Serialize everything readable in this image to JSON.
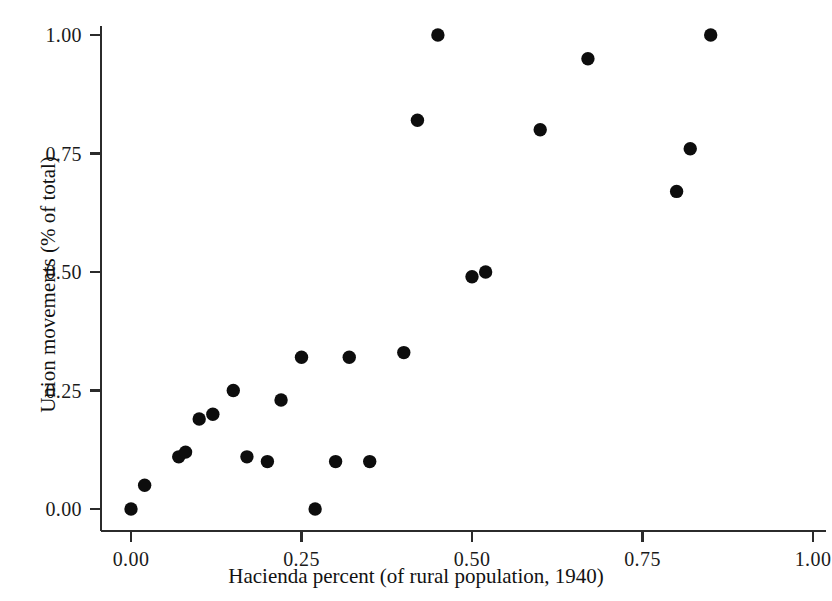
{
  "chart_data": {
    "type": "scatter",
    "title": "",
    "xlabel": "Hacienda percent (of rural population, 1940)",
    "ylabel": "Union movements (% of total)",
    "xlim": [
      0.0,
      1.0
    ],
    "ylim": [
      0.0,
      1.0
    ],
    "xticks": [
      "0.00",
      "0.25",
      "0.50",
      "0.75",
      "1.00"
    ],
    "xtick_values": [
      0.0,
      0.25,
      0.5,
      0.75,
      1.0
    ],
    "yticks": [
      "0.00",
      "0.25",
      "0.50",
      "0.75",
      "1.00"
    ],
    "ytick_values": [
      0.0,
      0.25,
      0.5,
      0.75,
      1.0
    ],
    "grid": false,
    "legend": false,
    "marker": "filled-circle",
    "marker_color": "#0d0d0d",
    "marker_size": 7,
    "point_count": 24,
    "x": [
      0.0,
      0.02,
      0.07,
      0.08,
      0.1,
      0.12,
      0.15,
      0.17,
      0.17,
      0.2,
      0.22,
      0.25,
      0.27,
      0.3,
      0.32,
      0.35,
      0.4,
      0.42,
      0.45,
      0.5,
      0.52,
      0.6,
      0.67,
      0.8,
      0.82,
      0.85
    ],
    "y": [
      0.0,
      0.05,
      0.11,
      0.12,
      0.19,
      0.2,
      0.25,
      0.11,
      0.11,
      0.1,
      0.23,
      0.32,
      0.0,
      0.1,
      0.32,
      0.1,
      0.33,
      0.82,
      1.0,
      0.49,
      0.5,
      0.8,
      0.95,
      0.67,
      0.76,
      1.0
    ],
    "points": [
      {
        "x": 0.0,
        "y": 0.0
      },
      {
        "x": 0.02,
        "y": 0.05
      },
      {
        "x": 0.07,
        "y": 0.11
      },
      {
        "x": 0.08,
        "y": 0.12
      },
      {
        "x": 0.1,
        "y": 0.19
      },
      {
        "x": 0.12,
        "y": 0.2
      },
      {
        "x": 0.15,
        "y": 0.25
      },
      {
        "x": 0.17,
        "y": 0.11
      },
      {
        "x": 0.2,
        "y": 0.1
      },
      {
        "x": 0.22,
        "y": 0.23
      },
      {
        "x": 0.25,
        "y": 0.32
      },
      {
        "x": 0.27,
        "y": 0.0
      },
      {
        "x": 0.3,
        "y": 0.1
      },
      {
        "x": 0.32,
        "y": 0.32
      },
      {
        "x": 0.35,
        "y": 0.1
      },
      {
        "x": 0.4,
        "y": 0.33
      },
      {
        "x": 0.42,
        "y": 0.82
      },
      {
        "x": 0.45,
        "y": 1.0
      },
      {
        "x": 0.5,
        "y": 0.49
      },
      {
        "x": 0.52,
        "y": 0.5
      },
      {
        "x": 0.6,
        "y": 0.8
      },
      {
        "x": 0.67,
        "y": 0.95
      },
      {
        "x": 0.8,
        "y": 0.67
      },
      {
        "x": 0.82,
        "y": 0.76
      },
      {
        "x": 0.85,
        "y": 1.0
      }
    ]
  },
  "axes": {
    "background_color": "#ffffff",
    "axis_color": "#2b2b2b"
  }
}
